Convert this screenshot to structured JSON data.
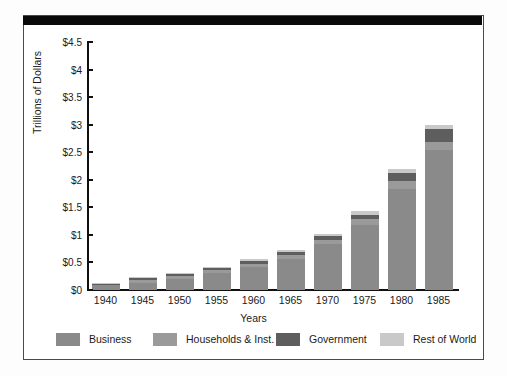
{
  "chart_data": {
    "type": "bar",
    "subtype": "stacked-bar",
    "title": "",
    "xlabel": "Years",
    "ylabel": "Trillions of Dollars",
    "categories": [
      "1940",
      "1945",
      "1950",
      "1955",
      "1960",
      "1965",
      "1970",
      "1975",
      "1980",
      "1985"
    ],
    "ylim": [
      0,
      4.5
    ],
    "ytick_values": [
      0,
      0.5,
      1,
      1.5,
      2,
      2.5,
      3,
      3.5,
      4,
      4.5
    ],
    "ytick_labels": [
      "$0",
      "$0.5",
      "$1",
      "$1.5",
      "$2",
      "$2.5",
      "$3",
      "$3.5",
      "$4",
      "$4.5"
    ],
    "y_tick_step": 0.5,
    "grid": false,
    "legend_position": "bottom",
    "value_prefix": "$",
    "value_unit": "trillions",
    "series": [
      {
        "name": "Business",
        "color": "#8a8a8a",
        "values": [
          0.09,
          0.11,
          0.17,
          0.26,
          0.3,
          0.36,
          0.46,
          0.62,
          0.95,
          1.32
        ]
      },
      {
        "name": "Households & Inst.",
        "color": "#9a9a9a",
        "values": [
          0.01,
          0.05,
          0.04,
          0.04,
          0.05,
          0.07,
          0.09,
          0.13,
          0.17,
          0.21
        ]
      },
      {
        "name": "Government",
        "color": "#5e5e5e",
        "values": [
          0.01,
          0.04,
          0.03,
          0.03,
          0.04,
          0.05,
          0.06,
          0.08,
          0.13,
          0.17
        ]
      },
      {
        "name": "Rest of World",
        "color": "#c9c9c9",
        "values": [
          0.005,
          0.02,
          0.02,
          0.02,
          0.02,
          0.03,
          0.03,
          0.04,
          0.05,
          0.08
        ]
      }
    ],
    "totals": [
      0.115,
      0.22,
      0.26,
      0.35,
      0.41,
      0.51,
      0.64,
      0.87,
      1.3,
      1.78
    ],
    "stacked_tops": [
      0.12,
      0.23,
      0.28,
      0.4,
      0.51,
      0.67,
      0.88,
      1.21,
      1.72,
      2.35
    ],
    "bars": [
      {
        "year": "1940",
        "total": 0.12,
        "segments": [
          {
            "name": "Business",
            "value": 0.095
          },
          {
            "name": "Households & Inst.",
            "value": 0.012
          },
          {
            "name": "Government",
            "value": 0.008
          },
          {
            "name": "Rest of World",
            "value": 0.005
          }
        ]
      },
      {
        "year": "1945",
        "total": 0.245,
        "segments": [
          {
            "name": "Business",
            "value": 0.135
          },
          {
            "name": "Households & Inst.",
            "value": 0.048
          },
          {
            "name": "Government",
            "value": 0.04
          },
          {
            "name": "Rest of World",
            "value": 0.022
          }
        ]
      },
      {
        "year": "1950",
        "total": 0.305,
        "segments": [
          {
            "name": "Business",
            "value": 0.195
          },
          {
            "name": "Households & Inst.",
            "value": 0.053
          },
          {
            "name": "Government",
            "value": 0.035
          },
          {
            "name": "Rest of World",
            "value": 0.022
          }
        ]
      },
      {
        "year": "1955",
        "total": 0.425,
        "segments": [
          {
            "name": "Business",
            "value": 0.315
          },
          {
            "name": "Households & Inst.",
            "value": 0.05
          },
          {
            "name": "Government",
            "value": 0.035
          },
          {
            "name": "Rest of World",
            "value": 0.025
          }
        ]
      },
      {
        "year": "1960",
        "total": 0.555,
        "segments": [
          {
            "name": "Business",
            "value": 0.42
          },
          {
            "name": "Households & Inst.",
            "value": 0.055
          },
          {
            "name": "Government",
            "value": 0.045
          },
          {
            "name": "Rest of World",
            "value": 0.035
          }
        ]
      },
      {
        "year": "1965",
        "total": 0.735,
        "segments": [
          {
            "name": "Business",
            "value": 0.56
          },
          {
            "name": "Households & Inst.",
            "value": 0.07
          },
          {
            "name": "Government",
            "value": 0.06
          },
          {
            "name": "Rest of World",
            "value": 0.045
          }
        ]
      },
      {
        "year": "1970",
        "total": 1.025,
        "segments": [
          {
            "name": "Business",
            "value": 0.83
          },
          {
            "name": "Households & Inst.",
            "value": 0.085
          },
          {
            "name": "Government",
            "value": 0.065
          },
          {
            "name": "Rest of World",
            "value": 0.045
          }
        ]
      },
      {
        "year": "1975",
        "total": 1.425,
        "segments": [
          {
            "name": "Business",
            "value": 1.185
          },
          {
            "name": "Households & Inst.",
            "value": 0.095
          },
          {
            "name": "Government",
            "value": 0.09
          },
          {
            "name": "Rest of World",
            "value": 0.055
          }
        ]
      },
      {
        "year": "1980",
        "total": 2.2,
        "segments": [
          {
            "name": "Business",
            "value": 1.84
          },
          {
            "name": "Households & Inst.",
            "value": 0.13
          },
          {
            "name": "Government",
            "value": 0.16
          },
          {
            "name": "Rest of World",
            "value": 0.07
          }
        ]
      },
      {
        "year": "1985",
        "total": 3.0,
        "segments": [
          {
            "name": "Business",
            "value": 2.54
          },
          {
            "name": "Households & Inst.",
            "value": 0.15
          },
          {
            "name": "Government",
            "value": 0.23
          },
          {
            "name": "Rest of World",
            "value": 0.08
          }
        ]
      }
    ],
    "bar_top_readings": {
      "1940": 0.12,
      "1945": 0.23,
      "1950": 0.29,
      "1955": 0.4,
      "1960": 0.52,
      "1965": 0.7,
      "1970": 0.98,
      "1975": 1.36,
      "1980": 2.08,
      "1985": 2.82
    }
  },
  "legend": {
    "items": [
      {
        "label": "Business",
        "color": "#8a8a8a"
      },
      {
        "label": "Households & Inst.",
        "color": "#9a9a9a"
      },
      {
        "label": "Government",
        "color": "#5e5e5e"
      },
      {
        "label": "Rest of World",
        "color": "#c9c9c9"
      }
    ]
  },
  "axes": {
    "y_title": "Trillions of Dollars",
    "x_title": "Years"
  }
}
